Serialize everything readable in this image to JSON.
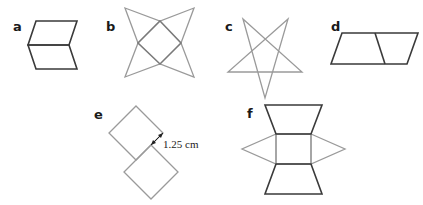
{
  "diagram": {
    "colors": {
      "dark_line": "#3a3a3a",
      "light_line": "#9a9a9a",
      "background": "#ffffff"
    },
    "figures": [
      {
        "id": "a",
        "label": "a",
        "description": "Two parallelograms joined along a horizontal edge (chevron shape)"
      },
      {
        "id": "b",
        "label": "b",
        "description": "Square rotated 45° with four triangles forming a four-pointed star"
      },
      {
        "id": "c",
        "label": "c",
        "description": "Five-pointed star (pentagram)"
      },
      {
        "id": "d",
        "label": "d",
        "description": "Parallelogram divided into two parts"
      },
      {
        "id": "e",
        "label": "e",
        "description": "Two rotated squares offset diagonally",
        "measurement": "1.25 cm"
      },
      {
        "id": "f",
        "label": "f",
        "description": "Square with two trapezoids (top/bottom) and two triangles (left/right)"
      }
    ]
  }
}
